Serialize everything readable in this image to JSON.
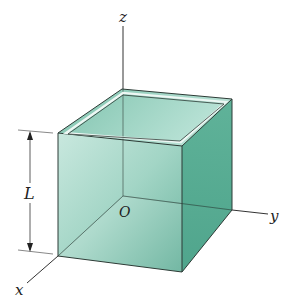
{
  "diagram": {
    "labels": {
      "z_axis": "z",
      "y_axis": "y",
      "x_axis": "x",
      "origin": "O",
      "dimension": "L"
    },
    "colors": {
      "front_face_light": "#c4e6dc",
      "front_face_dark": "#5faf98",
      "right_face": "#4fa68c",
      "inner_back": "#8fcbba",
      "rim": "#e8f4f0",
      "edge": "#2d3b36",
      "axis": "#333333"
    }
  }
}
